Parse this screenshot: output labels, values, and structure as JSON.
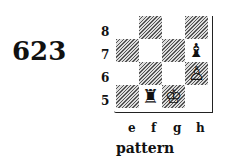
{
  "diagram_number": "623",
  "caption": "pattern",
  "ranks": [
    "8",
    "7",
    "6",
    "5"
  ],
  "files": [
    "e",
    "f",
    "g",
    "h"
  ],
  "pieces": [
    {
      "square": "h7",
      "piece": "black-bishop",
      "glyph": "♝"
    },
    {
      "square": "h6",
      "piece": "white-pawn",
      "glyph": "♙"
    },
    {
      "square": "f5",
      "piece": "black-rook",
      "glyph": "♜"
    },
    {
      "square": "g5",
      "piece": "white-king",
      "glyph": "♔"
    }
  ]
}
